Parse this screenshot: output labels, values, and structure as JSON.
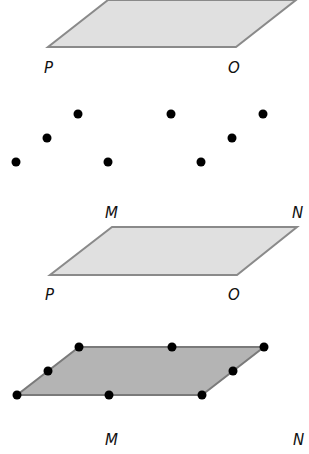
{
  "colors": {
    "light_fill": "#e0e0e0",
    "dark_fill": "#b4b4b4",
    "edge": "#8a8a8a",
    "dot": "#000000",
    "label": "#111111"
  },
  "panels": [
    {
      "name": "top-plane-1",
      "labels": {
        "left": "P",
        "right": "O"
      }
    },
    {
      "name": "dots-1",
      "labels": {
        "left": "M",
        "right": "N"
      }
    },
    {
      "name": "top-plane-2",
      "labels": {
        "left": "P",
        "right": "O"
      }
    },
    {
      "name": "filled-plane-with-dots",
      "labels": {
        "left": "M",
        "right": "N"
      }
    }
  ],
  "dots_group_1": [
    [
      78,
      114
    ],
    [
      47,
      138
    ],
    [
      16,
      162
    ],
    [
      108,
      162
    ],
    [
      171,
      114
    ],
    [
      263,
      114
    ],
    [
      232,
      138
    ],
    [
      201,
      162
    ]
  ],
  "dots_group_2": [
    [
      79,
      347
    ],
    [
      48,
      371
    ],
    [
      17,
      395
    ],
    [
      109,
      395
    ],
    [
      172,
      347
    ],
    [
      264,
      347
    ],
    [
      233,
      371
    ],
    [
      202,
      395
    ]
  ]
}
